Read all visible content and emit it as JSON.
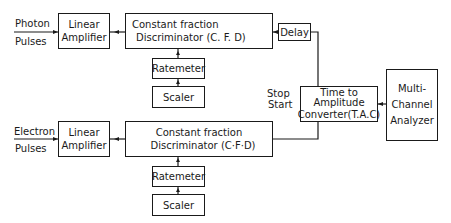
{
  "inputs": {
    "photon": {
      "line1": "Photon",
      "line2": "Pulses"
    },
    "electron": {
      "line1": "Electron",
      "line2": "Pulses"
    }
  },
  "top_chain": {
    "linear_amplifier": {
      "line1": "Linear",
      "line2": "Amplifier"
    },
    "cfd": {
      "line1": "Constant fraction",
      "line2": "Discriminator (C. F. D)"
    },
    "delay": "Delay",
    "ratemeter": "Ratemeter",
    "scaler": "Scaler"
  },
  "bottom_chain": {
    "linear_amplifier": {
      "line1": "Linear",
      "line2": "Amplifier"
    },
    "cfd": {
      "line1": "Constant fraction",
      "line2": "Discriminator (C·F·D)"
    },
    "ratemeter": "Ratemeter",
    "scaler": "Scaler"
  },
  "tac": {
    "line1": "Time to",
    "line2": "Amplitude",
    "line3": "Converter(T.A.C)",
    "stop_label": "Stop",
    "start_label": "Start"
  },
  "mca": {
    "line1": "Multi-",
    "line2": "Channel",
    "line3": "Analyzer"
  }
}
